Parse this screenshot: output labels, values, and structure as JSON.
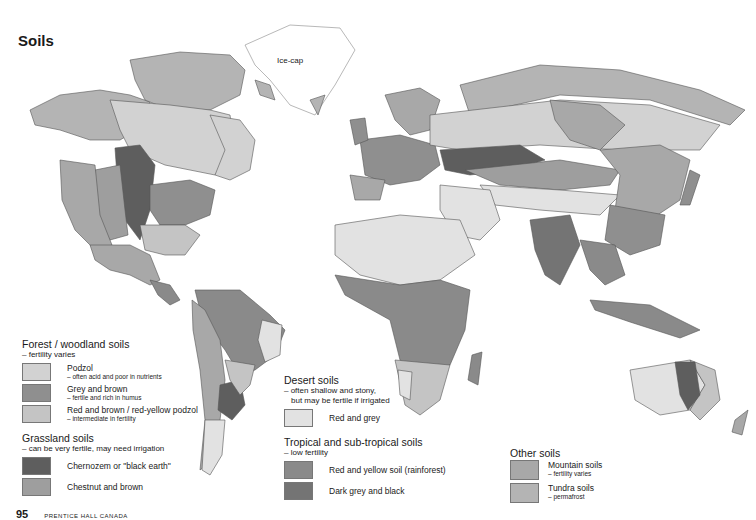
{
  "title": "Soils",
  "map": {
    "icecap_label": "Ice-cap"
  },
  "legend": {
    "forest": {
      "title": "Forest / woodland soils",
      "subtitle": "– fertility varies",
      "items": [
        {
          "label": "Podzol",
          "note": "– often acid and poor in nutrients",
          "color": "#d2d2d2"
        },
        {
          "label": "Grey and brown",
          "note": "– fertile and rich in humus",
          "color": "#8f8f8f"
        },
        {
          "label": "Red and brown / red-yellow podzol",
          "note": "– intermediate in fertility",
          "color": "#c4c4c4"
        }
      ]
    },
    "grassland": {
      "title": "Grassland soils",
      "subtitle": "– can be very fertile, may need irrigation",
      "items": [
        {
          "label": "Chernozem or \"black earth\"",
          "note": "",
          "color": "#5e5e5e"
        },
        {
          "label": "Chestnut and brown",
          "note": "",
          "color": "#9e9e9e"
        }
      ]
    },
    "desert": {
      "title": "Desert soils",
      "subtitle_line1": "– often shallow and stony,",
      "subtitle_line2": "but may be fertile if irrigated",
      "items": [
        {
          "label": "Red and grey",
          "note": "",
          "color": "#e2e2e2"
        }
      ]
    },
    "tropical": {
      "title": "Tropical and sub-tropical soils",
      "subtitle": "– low fertility",
      "items": [
        {
          "label": "Red and yellow soil (rainforest)",
          "note": "",
          "color": "#8a8a8a"
        },
        {
          "label": "Dark grey and black",
          "note": "",
          "color": "#747474"
        }
      ]
    },
    "other": {
      "title": "Other soils",
      "items": [
        {
          "label": "Mountain soils",
          "note": "– fertility varies",
          "color": "#a8a8a8"
        },
        {
          "label": "Tundra soils",
          "note": "– permafrost",
          "color": "#b4b4b4"
        }
      ]
    }
  },
  "footer": {
    "page_number": "95",
    "publisher": "PRENTICE HALL CANADA"
  }
}
